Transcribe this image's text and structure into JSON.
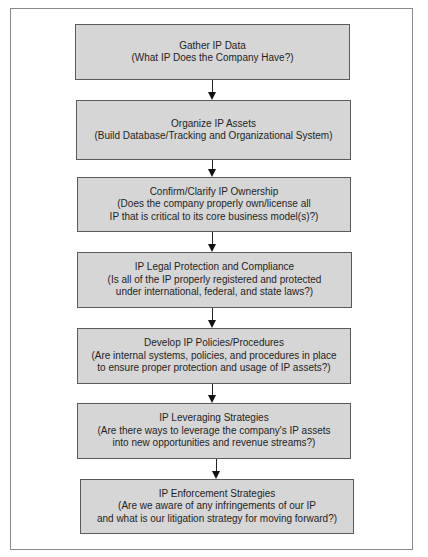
{
  "diagram": {
    "type": "vertical-flowchart",
    "colors": {
      "box_fill": "#d6d6d6",
      "box_border": "#5a5a5a",
      "arrow": "#111111",
      "frame_border": "#8a8a8a",
      "text": "#1e1e1e"
    },
    "steps": [
      {
        "title": "Gather IP Data",
        "lines": [
          "(What IP Does the Company Have?)"
        ]
      },
      {
        "title": "Organize IP Assets",
        "lines": [
          "(Build Database/Tracking and Organizational System)"
        ]
      },
      {
        "title": "Confirm/Clarify IP Ownership",
        "lines": [
          "(Does the company properly own/license all",
          "IP that is critical to its core business model(s)?)"
        ]
      },
      {
        "title": "IP Legal Protection and Compliance",
        "lines": [
          "(Is all of the IP properly registered and protected",
          "under international, federal, and state laws?)"
        ]
      },
      {
        "title": "Develop IP Policies/Procedures",
        "lines": [
          "(Are internal systems, policies, and procedures in place",
          "to ensure proper protection and usage of IP assets?)"
        ]
      },
      {
        "title": "IP Leveraging Strategies",
        "lines": [
          "(Are there ways to leverage the company's IP assets",
          "into new opportunities and revenue streams?)"
        ]
      },
      {
        "title": "IP Enforcement Strategies",
        "lines": [
          "(Are we aware of any infringements of our IP",
          "and what is our litigation strategy for moving forward?)"
        ]
      }
    ],
    "connections": [
      {
        "from": 0,
        "to": 1
      },
      {
        "from": 1,
        "to": 2
      },
      {
        "from": 2,
        "to": 3
      },
      {
        "from": 3,
        "to": 4
      },
      {
        "from": 4,
        "to": 5
      },
      {
        "from": 5,
        "to": 6
      }
    ]
  }
}
